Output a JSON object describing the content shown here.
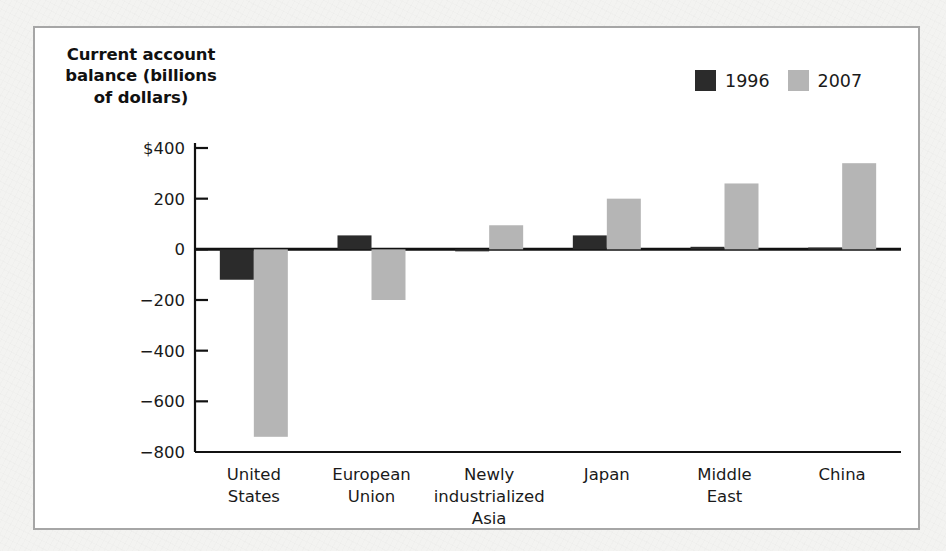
{
  "figure": {
    "axis_title_lines": [
      "Current account",
      "balance (billions",
      "of dollars)"
    ],
    "frame_color": "#a6a6a6",
    "background_color": "#ffffff"
  },
  "legend": {
    "position": "top-right",
    "entries": [
      {
        "label": "1996",
        "color": "#2b2b2b",
        "swatch_name": "legend-swatch-1996"
      },
      {
        "label": "2007",
        "color": "#b5b5b5",
        "swatch_name": "legend-swatch-2007"
      }
    ]
  },
  "chart_data": {
    "type": "bar",
    "title": "",
    "subtitle": "",
    "xlabel": "",
    "ylabel": "Current account balance (billions of dollars)",
    "ylim": [
      -800,
      400
    ],
    "ytick_labels": [
      "$400",
      "200",
      "0",
      "-200",
      "-400",
      "-600",
      "-800"
    ],
    "ytick_values": [
      400,
      200,
      0,
      -200,
      -400,
      -600,
      -800
    ],
    "grid": false,
    "legend_position": "top-right",
    "categories": [
      "United States",
      "European Union",
      "Newly industrialized Asia",
      "Japan",
      "Middle East",
      "China"
    ],
    "category_label_lines": [
      [
        "United",
        "States"
      ],
      [
        "European",
        "Union"
      ],
      [
        "Newly",
        "industrialized",
        "Asia"
      ],
      [
        "Japan"
      ],
      [
        "Middle",
        "East"
      ],
      [
        "China"
      ]
    ],
    "series": [
      {
        "name": "1996",
        "color": "#2b2b2b",
        "values": [
          -120,
          55,
          -8,
          55,
          10,
          7
        ]
      },
      {
        "name": "2007",
        "color": "#b5b5b5",
        "values": [
          -740,
          -200,
          95,
          200,
          260,
          340
        ]
      }
    ]
  }
}
